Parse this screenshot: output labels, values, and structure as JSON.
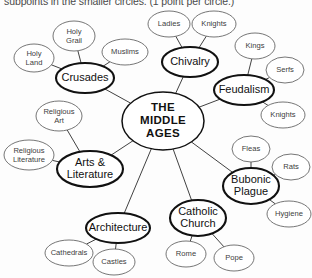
{
  "header": {
    "instruction": "subpoints in the smaller circles. (1 point per circle.)"
  },
  "colors": {
    "page_background": "#fdfdfd",
    "center_stroke": "#111111",
    "main_stroke": "#111111",
    "sub_stroke": "#5d5d5d",
    "edge_stroke": "#2b2b2b",
    "text": "#111111",
    "sub_text": "#404040"
  },
  "chart_data": {
    "type": "diagram",
    "diagram_kind": "mind-map",
    "center": {
      "id": "center",
      "label_lines": [
        "THE",
        "MIDDLE",
        "AGES"
      ],
      "label": "THE MIDDLE AGES",
      "cx": 163,
      "cy": 121,
      "rx": 41,
      "ry": 29
    },
    "branches": [
      {
        "id": "crusades",
        "label": "Crusades",
        "cx": 85,
        "cy": 78,
        "rx": 29,
        "ry": 15,
        "children": [
          {
            "id": "holy-grail",
            "label_lines": [
              "Holy",
              "Grail"
            ],
            "label": "Holy Grail",
            "cx": 74,
            "cy": 36,
            "rx": 21,
            "ry": 15
          },
          {
            "id": "holy-land",
            "label_lines": [
              "Holy",
              "Land"
            ],
            "label": "Holy Land",
            "cx": 34,
            "cy": 58,
            "rx": 20,
            "ry": 14
          },
          {
            "id": "muslims",
            "label": "Muslims",
            "cx": 125,
            "cy": 52,
            "rx": 23,
            "ry": 13
          }
        ]
      },
      {
        "id": "chivalry",
        "label": "Chivalry",
        "cx": 190,
        "cy": 62,
        "rx": 28,
        "ry": 15,
        "children": [
          {
            "id": "ladies",
            "label": "Ladies",
            "cx": 169,
            "cy": 24,
            "rx": 21,
            "ry": 13
          },
          {
            "id": "knights-chivalry",
            "label": "Knights",
            "cx": 214,
            "cy": 24,
            "rx": 22,
            "ry": 13
          }
        ]
      },
      {
        "id": "feudalism",
        "label": "Feudalism",
        "cx": 244,
        "cy": 90,
        "rx": 30,
        "ry": 15,
        "children": [
          {
            "id": "kings",
            "label": "Kings",
            "cx": 255,
            "cy": 46,
            "rx": 20,
            "ry": 13
          },
          {
            "id": "serfs",
            "label": "Serfs",
            "cx": 285,
            "cy": 70,
            "rx": 19,
            "ry": 13
          },
          {
            "id": "knights-feudalism",
            "label": "Knights",
            "cx": 283,
            "cy": 115,
            "rx": 22,
            "ry": 13
          }
        ]
      },
      {
        "id": "bubonic-plague",
        "label_lines": [
          "Bubonic",
          "Plague"
        ],
        "label": "Bubonic Plague",
        "cx": 251,
        "cy": 186,
        "rx": 28,
        "ry": 18,
        "children": [
          {
            "id": "fleas",
            "label": "Fleas",
            "cx": 251,
            "cy": 149,
            "rx": 19,
            "ry": 13
          },
          {
            "id": "rats",
            "label": "Rats",
            "cx": 291,
            "cy": 167,
            "rx": 19,
            "ry": 13
          },
          {
            "id": "hygiene",
            "label": "Hygiene",
            "cx": 289,
            "cy": 214,
            "rx": 22,
            "ry": 13
          }
        ]
      },
      {
        "id": "catholic-church",
        "label_lines": [
          "Catholic",
          "Church"
        ],
        "label": "Catholic Church",
        "cx": 198,
        "cy": 218,
        "rx": 28,
        "ry": 18,
        "children": [
          {
            "id": "rome",
            "label": "Rome",
            "cx": 186,
            "cy": 254,
            "rx": 20,
            "ry": 13
          },
          {
            "id": "pope",
            "label": "Pope",
            "cx": 234,
            "cy": 258,
            "rx": 20,
            "ry": 13
          }
        ]
      },
      {
        "id": "architecture",
        "label": "Architecture",
        "cx": 118,
        "cy": 228,
        "rx": 32,
        "ry": 15,
        "children": [
          {
            "id": "cathedrals",
            "label": "Cathedrals",
            "cx": 69,
            "cy": 253,
            "rx": 24,
            "ry": 13
          },
          {
            "id": "castles",
            "label": "Castles",
            "cx": 114,
            "cy": 262,
            "rx": 21,
            "ry": 13
          }
        ]
      },
      {
        "id": "arts-literature",
        "label_lines": [
          "Arts &",
          "Literature"
        ],
        "label": "Arts & Literature",
        "cx": 90,
        "cy": 169,
        "rx": 33,
        "ry": 18,
        "children": [
          {
            "id": "religious-art",
            "label_lines": [
              "Religious",
              "Art"
            ],
            "label": "Religious Art",
            "cx": 59,
            "cy": 116,
            "rx": 23,
            "ry": 15
          },
          {
            "id": "religious-literature",
            "label_lines": [
              "Religious",
              "Literature"
            ],
            "label": "Religious Literature",
            "cx": 29,
            "cy": 155,
            "rx": 25,
            "ry": 15
          }
        ]
      }
    ],
    "edges": [
      {
        "from": "center",
        "to": "crusades"
      },
      {
        "from": "center",
        "to": "chivalry"
      },
      {
        "from": "center",
        "to": "feudalism"
      },
      {
        "from": "center",
        "to": "bubonic-plague"
      },
      {
        "from": "center",
        "to": "catholic-church"
      },
      {
        "from": "center",
        "to": "architecture"
      },
      {
        "from": "center",
        "to": "arts-literature"
      },
      {
        "from": "crusades",
        "to": "holy-grail"
      },
      {
        "from": "crusades",
        "to": "holy-land"
      },
      {
        "from": "crusades",
        "to": "muslims"
      },
      {
        "from": "chivalry",
        "to": "ladies"
      },
      {
        "from": "chivalry",
        "to": "knights-chivalry"
      },
      {
        "from": "feudalism",
        "to": "kings"
      },
      {
        "from": "feudalism",
        "to": "serfs"
      },
      {
        "from": "feudalism",
        "to": "knights-feudalism"
      },
      {
        "from": "bubonic-plague",
        "to": "fleas"
      },
      {
        "from": "bubonic-plague",
        "to": "rats"
      },
      {
        "from": "bubonic-plague",
        "to": "hygiene"
      },
      {
        "from": "catholic-church",
        "to": "rome"
      },
      {
        "from": "catholic-church",
        "to": "pope"
      },
      {
        "from": "architecture",
        "to": "cathedrals"
      },
      {
        "from": "architecture",
        "to": "castles"
      },
      {
        "from": "arts-literature",
        "to": "religious-art"
      },
      {
        "from": "arts-literature",
        "to": "religious-literature"
      }
    ]
  }
}
